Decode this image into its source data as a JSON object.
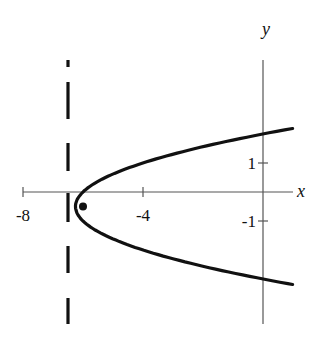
{
  "chart_data": {
    "type": "line",
    "title": "",
    "xlabel": "x",
    "ylabel": "y",
    "xlim": [
      -8,
      1
    ],
    "ylim": [
      -4.5,
      4.5
    ],
    "grid": false,
    "legend": null,
    "x_ticks": [
      {
        "value": -8,
        "label": "-8"
      },
      {
        "value": -4,
        "label": "-4"
      }
    ],
    "y_ticks": [
      {
        "value": 1,
        "label": "1"
      },
      {
        "value": -1,
        "label": "-1"
      }
    ],
    "series": [
      {
        "name": "parabola",
        "equation": "(y + 0.5)^2 = x + 6.25",
        "style": "solid",
        "vertex": [
          -6.25,
          -0.5
        ],
        "points": [
          [
            1,
            2.19
          ],
          [
            0,
            2.0
          ],
          [
            -1,
            1.79
          ],
          [
            -2,
            1.55
          ],
          [
            -3,
            1.3
          ],
          [
            -4,
            1.0
          ],
          [
            -5,
            0.62
          ],
          [
            -5.5,
            0.37
          ],
          [
            -6,
            0.0
          ],
          [
            -6.25,
            -0.5
          ],
          [
            -6,
            -1.0
          ],
          [
            -5.5,
            -1.37
          ],
          [
            -5,
            -1.62
          ],
          [
            -4,
            -2.0
          ],
          [
            -3,
            -2.3
          ],
          [
            -2,
            -2.55
          ],
          [
            -1,
            -2.79
          ],
          [
            0,
            -3.0
          ],
          [
            1,
            -3.19
          ]
        ]
      },
      {
        "name": "directrix",
        "equation": "x = -6.5",
        "style": "dashed",
        "x": -6.5
      }
    ],
    "annotations": [
      {
        "type": "point",
        "name": "focus",
        "x": -6,
        "y": -0.5
      }
    ]
  },
  "labels": {
    "x_axis": "x",
    "y_axis": "y",
    "x_tick_neg8": "-8",
    "x_tick_neg4": "-4",
    "y_tick_1": "1",
    "y_tick_neg1": "-1"
  }
}
